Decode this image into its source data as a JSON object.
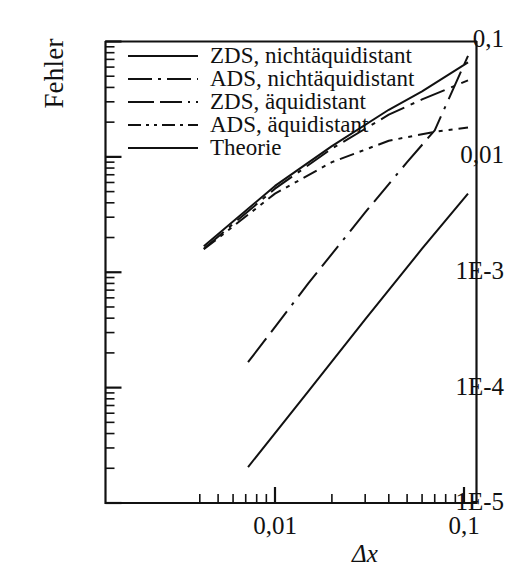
{
  "chart_data": {
    "type": "line",
    "title": "",
    "xlabel": "Δx",
    "ylabel": "Fehler",
    "xscale": "log",
    "yscale": "log",
    "xlim": [
      0.0035,
      0.115
    ],
    "ylim": [
      1e-05,
      0.1
    ],
    "grid": false,
    "legend_position": "upper-left-inside",
    "x_tick_labels": [
      "0,01",
      "0,1"
    ],
    "x_tick_values": [
      0.01,
      0.1
    ],
    "y_tick_labels": [
      "0,1",
      "0,01",
      "1E-3",
      "1E-4",
      "1E-5"
    ],
    "y_tick_values": [
      0.1,
      0.01,
      0.001,
      0.0001,
      1e-05
    ],
    "series": [
      {
        "name": "ZDS, nichtäquidistant",
        "dash": "solid",
        "points": [
          [
            0.0042,
            0.00168
          ],
          [
            0.01,
            0.0056
          ],
          [
            0.02,
            0.0124
          ],
          [
            0.04,
            0.0256
          ],
          [
            0.06,
            0.037
          ],
          [
            0.105,
            0.066
          ]
        ]
      },
      {
        "name": "ADS, nichtäquidistant",
        "dash": "dash-dot",
        "points": [
          [
            0.0042,
            0.0016
          ],
          [
            0.01,
            0.0053
          ],
          [
            0.02,
            0.0118
          ],
          [
            0.04,
            0.0232
          ],
          [
            0.06,
            0.0315
          ],
          [
            0.105,
            0.046
          ]
        ]
      },
      {
        "name": "ZDS, äquidistant",
        "dash": "long-dash",
        "points": [
          [
            0.0072,
            0.000166
          ],
          [
            0.015,
            0.0008
          ],
          [
            0.03,
            0.0033
          ],
          [
            0.05,
            0.009
          ],
          [
            0.07,
            0.017
          ],
          [
            0.105,
            0.075
          ]
        ]
      },
      {
        "name": "ADS, äquidistant",
        "dash": "dash-dot-dot",
        "points": [
          [
            0.0042,
            0.00158
          ],
          [
            0.01,
            0.0048
          ],
          [
            0.02,
            0.009
          ],
          [
            0.04,
            0.0138
          ],
          [
            0.07,
            0.0165
          ],
          [
            0.105,
            0.018
          ]
        ]
      },
      {
        "name": "Theorie",
        "dash": "solid",
        "points": [
          [
            0.0072,
            2.05e-05
          ],
          [
            0.015,
            9.3e-05
          ],
          [
            0.03,
            0.00039
          ],
          [
            0.06,
            0.0016
          ],
          [
            0.105,
            0.0048
          ]
        ]
      }
    ]
  },
  "axes": {
    "y_label": "Fehler",
    "x_label": "Δx",
    "y_ticks": [
      {
        "label": "0,1"
      },
      {
        "label": "0,01"
      },
      {
        "label": "1E-3"
      },
      {
        "label": "1E-4"
      },
      {
        "label": "1E-5"
      }
    ],
    "x_ticks": [
      {
        "label": "0,01"
      },
      {
        "label": "0,1"
      }
    ]
  },
  "legend": {
    "items": [
      {
        "label": "ZDS, nichtäquidistant"
      },
      {
        "label": "ADS, nichtäquidistant"
      },
      {
        "label": "ZDS, äquidistant"
      },
      {
        "label": "ADS, äquidistant"
      },
      {
        "label": "Theorie"
      }
    ]
  },
  "style": {
    "ink": "#111111",
    "background": "#ffffff"
  }
}
